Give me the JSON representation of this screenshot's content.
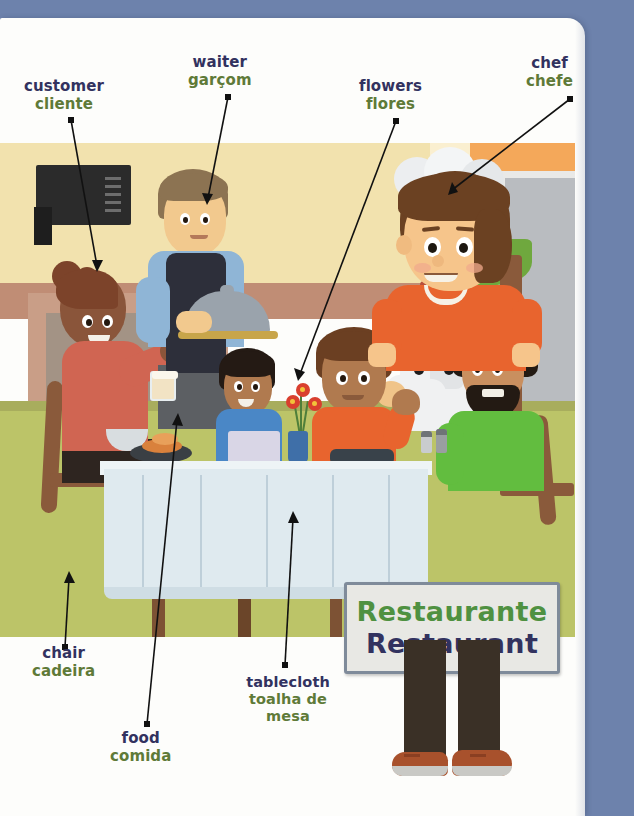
{
  "page": {
    "background_color": "#6d82ac",
    "paper_color": "#fdfdfb"
  },
  "sign": {
    "name": "restaurant-sign",
    "line_pt": "Restaurante",
    "line_en": "Restaurant",
    "pt_color": "#4f9141",
    "en_color": "#32325f",
    "board_color": "#e8e8e4",
    "frame_color": "#7f8b9a"
  },
  "label_colors": {
    "english": "#32325f",
    "portuguese": "#5f7a38"
  },
  "labels": [
    {
      "id": "customer",
      "en": "customer",
      "pt": "cliente",
      "x": 24,
      "y": 78,
      "dot": {
        "x": 71,
        "y": 120
      },
      "tip": {
        "x": 97,
        "y": 266
      }
    },
    {
      "id": "waiter",
      "en": "waiter",
      "pt": "garçom",
      "x": 188,
      "y": 54,
      "dot": {
        "x": 228,
        "y": 97
      },
      "tip": {
        "x": 208,
        "y": 198
      }
    },
    {
      "id": "flowers",
      "en": "flowers",
      "pt": "flores",
      "x": 359,
      "y": 78,
      "dot": {
        "x": 396,
        "y": 121
      },
      "tip": {
        "x": 300,
        "y": 374
      }
    },
    {
      "id": "chef",
      "en": "chef",
      "pt": "chefe",
      "x": 526,
      "y": 55,
      "dot": {
        "x": 570,
        "y": 99
      },
      "tip": {
        "x": 452,
        "y": 190
      }
    },
    {
      "id": "chair",
      "en": "chair",
      "pt": "cadeira",
      "x": 32,
      "y": 645,
      "dot": {
        "x": 65,
        "y": 647
      },
      "tip": {
        "x": 69,
        "y": 578
      }
    },
    {
      "id": "food",
      "en": "food",
      "pt": "comida",
      "x": 110,
      "y": 730,
      "dot": {
        "x": 147,
        "y": 724
      },
      "tip": {
        "x": 177,
        "y": 420
      }
    },
    {
      "id": "tablecloth",
      "en": "tablecloth",
      "pt": "toalha de mesa",
      "x": 228,
      "y": 674,
      "dot": {
        "x": 285,
        "y": 665
      },
      "tip": {
        "x": 293,
        "y": 518
      }
    }
  ],
  "illustration": {
    "name": "restaurant-scene",
    "alt": "Cartoon restaurant scene with customer, waiter, chef, children at a table and a boy holding a sign",
    "palette": {
      "wall_cream": "#f2e2ae",
      "wall_orange": "#f4a85a",
      "wall_lower": "#c08d75",
      "floor": "#bcc468",
      "doorway": "#b9bcc0",
      "tablecloth": "#dfeaef",
      "chair_wood": "#8a5a3b",
      "customer_top": "#d06552",
      "waiter_shirt": "#8fb5d6",
      "waiter_vest": "#2d2f3a",
      "chef_coat": "#f0f1f2",
      "green_shirt": "#62bd3f",
      "boy_shirt": "#e8642e",
      "flower_red": "#d93f2e",
      "vase_blue": "#3f6fa8"
    },
    "figures": [
      {
        "name": "customer-figure",
        "description": "woman in coral top with hair bun holding a drink"
      },
      {
        "name": "waiter-figure",
        "description": "man in blue shirt and dark vest carrying a covered silver dish"
      },
      {
        "name": "child-blue-figure",
        "description": "young child in blue shirt at the table"
      },
      {
        "name": "child-orange-figure",
        "description": "boy in orange shirt at the table"
      },
      {
        "name": "chef-figure",
        "description": "chef in white toque and double-breasted jacket"
      },
      {
        "name": "bearded-man-figure",
        "description": "bearded man in green shirt seated at right"
      },
      {
        "name": "foreground-boy-figure",
        "description": "boy in orange shirt holding the restaurant sign"
      }
    ],
    "objects": [
      {
        "name": "chalkboard-menu"
      },
      {
        "name": "flower-vase"
      },
      {
        "name": "salt-pepper-shakers"
      },
      {
        "name": "dinner-plate-with-food"
      },
      {
        "name": "drinking-glass"
      },
      {
        "name": "tree-trunk"
      }
    ]
  }
}
